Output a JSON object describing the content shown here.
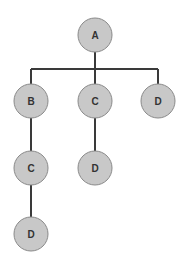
{
  "diagram": {
    "type": "tree",
    "nodes": [
      {
        "id": "n1",
        "label": "A",
        "x": 95,
        "y": 35
      },
      {
        "id": "n2",
        "label": "B",
        "x": 31,
        "y": 101
      },
      {
        "id": "n3",
        "label": "C",
        "x": 95,
        "y": 101
      },
      {
        "id": "n4",
        "label": "D",
        "x": 158,
        "y": 101
      },
      {
        "id": "n5",
        "label": "C",
        "x": 31,
        "y": 168
      },
      {
        "id": "n6",
        "label": "D",
        "x": 95,
        "y": 168
      },
      {
        "id": "n7",
        "label": "D",
        "x": 31,
        "y": 234
      }
    ],
    "edges": [
      {
        "from": "n1",
        "to": "n2"
      },
      {
        "from": "n1",
        "to": "n3"
      },
      {
        "from": "n1",
        "to": "n4"
      },
      {
        "from": "n2",
        "to": "n5"
      },
      {
        "from": "n3",
        "to": "n6"
      },
      {
        "from": "n5",
        "to": "n7"
      }
    ],
    "colors": {
      "node_fill": "#c8c8c8",
      "edge": "#3a3a3a"
    }
  }
}
